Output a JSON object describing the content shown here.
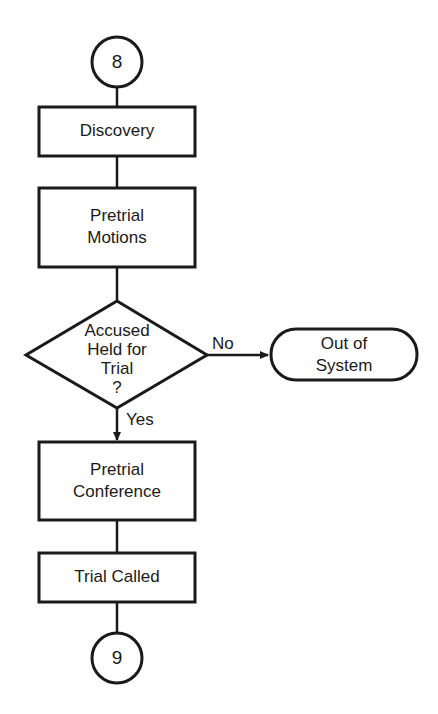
{
  "diagram": {
    "type": "flowchart",
    "connectors": {
      "top": {
        "label": "8"
      },
      "bottom": {
        "label": "9"
      }
    },
    "nodes": {
      "discovery": {
        "lines": [
          "Discovery"
        ]
      },
      "pretrial_motions": {
        "lines": [
          "Pretrial",
          "Motions"
        ]
      },
      "decision": {
        "lines": [
          "Accused",
          "Held for",
          "Trial",
          "?"
        ]
      },
      "out_of_system": {
        "lines": [
          "Out of",
          "System"
        ]
      },
      "pretrial_conference": {
        "lines": [
          "Pretrial",
          "Conference"
        ]
      },
      "trial_called": {
        "lines": [
          "Trial Called"
        ]
      }
    },
    "edges": {
      "no_label": "No",
      "yes_label": "Yes"
    },
    "colors": {
      "ink": "#1a1a1a",
      "background": "#ffffff"
    }
  }
}
